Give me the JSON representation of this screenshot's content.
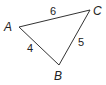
{
  "diagram": {
    "type": "triangle",
    "vertices": [
      {
        "label": "A",
        "x": 19,
        "y": 27,
        "label_x": 4,
        "label_y": 31
      },
      {
        "label": "B",
        "x": 59,
        "y": 65,
        "label_x": 54,
        "label_y": 80
      },
      {
        "label": "C",
        "x": 90,
        "y": 10,
        "label_x": 93,
        "label_y": 15
      }
    ],
    "sides": [
      {
        "between": "A-C",
        "length": "6",
        "label_x": 50,
        "label_y": 15
      },
      {
        "between": "A-B",
        "length": "4",
        "label_x": 27,
        "label_y": 52
      },
      {
        "between": "B-C",
        "length": "5",
        "label_x": 78,
        "label_y": 46
      }
    ],
    "stroke_color": "#333333"
  }
}
